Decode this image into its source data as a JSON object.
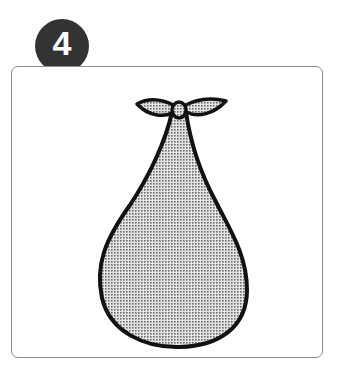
{
  "step": {
    "number": "4"
  },
  "illustration": {
    "subject": "tied-cloth-bundle-icon",
    "fill_color": "#b8b8b8",
    "outline_color": "#111111"
  },
  "colors": {
    "badge": "#333333",
    "frame_border": "#8a8a8a",
    "background": "#ffffff"
  }
}
